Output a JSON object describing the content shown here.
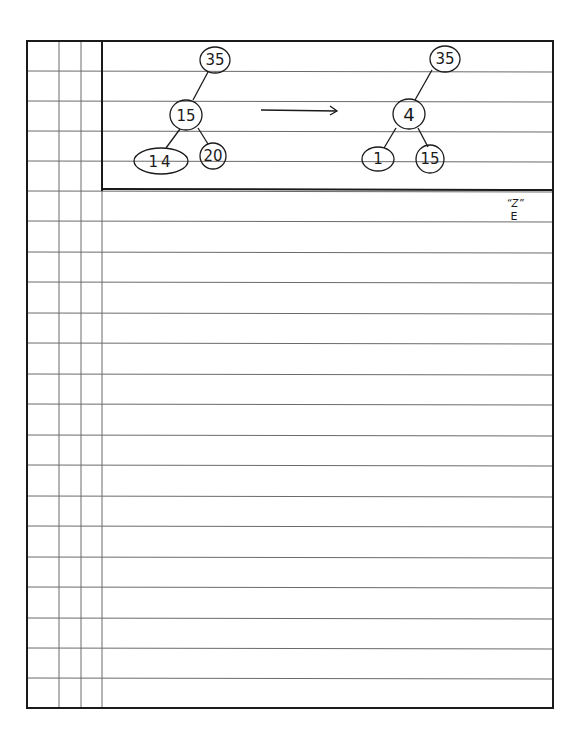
{
  "page": {
    "type": "ruled notebook page",
    "line_color": "#555555",
    "border_color": "#1a1a1a"
  },
  "diagram": {
    "before_tree": {
      "root": "35",
      "child": "15",
      "grandchildren": [
        "14",
        "20"
      ]
    },
    "arrow": "→",
    "after_tree": {
      "root": "35",
      "child": "4",
      "grandchildren": [
        "1",
        "15"
      ]
    }
  },
  "annotation": {
    "top": "“Z”",
    "bottom": "E"
  }
}
